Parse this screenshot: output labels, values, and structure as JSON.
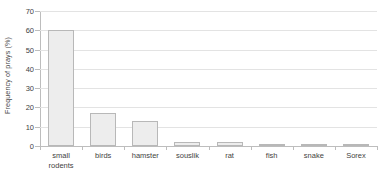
{
  "chart_data": {
    "type": "bar",
    "title": "",
    "xlabel": "",
    "ylabel": "Frequency of prays (%)",
    "categories": [
      "small rodents",
      "birds",
      "hamster",
      "souslik",
      "rat",
      "fish",
      "snake",
      "Sorex"
    ],
    "category_lines": [
      [
        "small",
        "rodents"
      ],
      [
        "birds",
        ""
      ],
      [
        "hamster",
        ""
      ],
      [
        "souslik",
        ""
      ],
      [
        "rat",
        ""
      ],
      [
        "fish",
        ""
      ],
      [
        "snake",
        ""
      ],
      [
        "Sorex",
        ""
      ]
    ],
    "values": [
      60,
      17,
      13,
      2,
      2,
      0.7,
      0.7,
      0.7
    ],
    "ylim": [
      0,
      70
    ],
    "yticks": [
      0,
      10,
      20,
      30,
      40,
      50,
      60,
      70
    ],
    "ytick_labels": [
      "0",
      "10",
      "20",
      "30",
      "40",
      "50",
      "60",
      "70"
    ],
    "grid": true,
    "grid_axis": "y",
    "legend": false,
    "bar_fill": "#ededed",
    "bar_border": "#b8b8b8",
    "grid_color": "#e3e3e3",
    "axis_color": "#bdbdbd",
    "text_color": "#3f3f3f"
  }
}
